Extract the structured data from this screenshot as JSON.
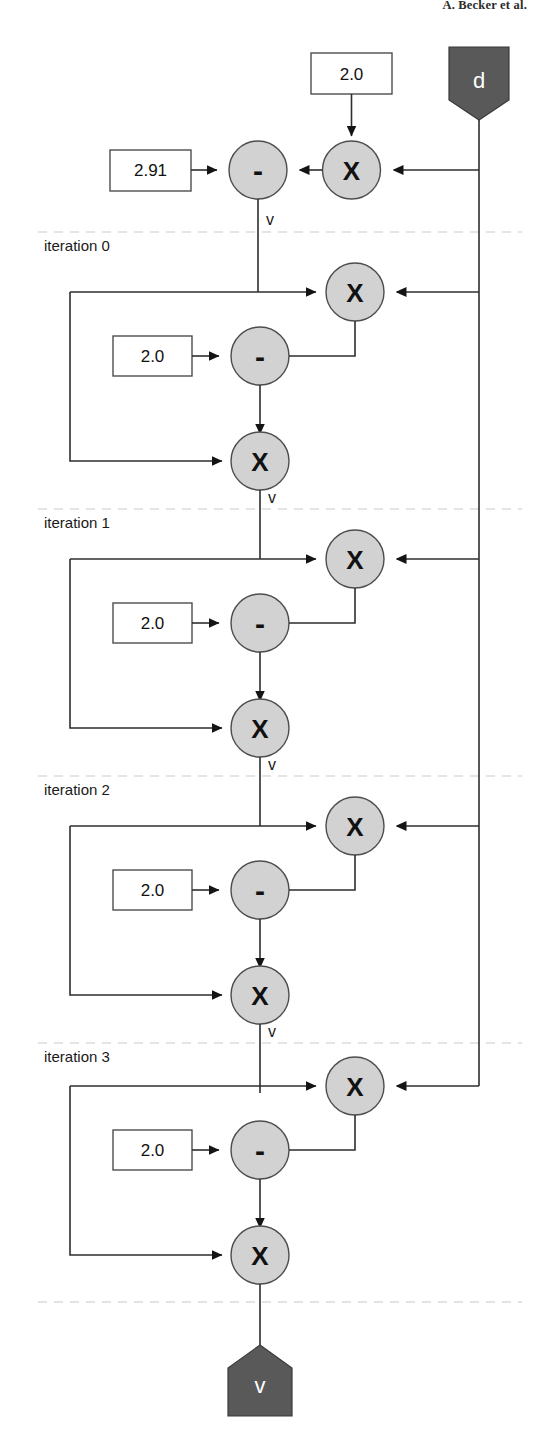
{
  "header": {
    "running_head": "A. Becker et al."
  },
  "diagram": {
    "colors": {
      "node_fill": "#d2d2d2",
      "node_stroke": "#4d4d4d",
      "terminal_fill": "#595959",
      "edge": "#2e2e2e",
      "separator": "#c9c9c9",
      "box_fill": "#ffffff"
    },
    "input_terminal": {
      "label": "d",
      "shape": "pentagon-down"
    },
    "output_terminal": {
      "label": "v",
      "shape": "pentagon-up"
    },
    "edge_variable_label": "v",
    "top_block": {
      "seed_const": "2.91",
      "mul_const": "2.0",
      "mul_op": "X",
      "sub_op": "-",
      "out_label": "v"
    },
    "iterations": [
      {
        "label": "iteration 0",
        "const": "2.0",
        "mul_top_op": "X",
        "sub_op": "-",
        "mul_bottom_op": "X",
        "out_label": "v"
      },
      {
        "label": "iteration 1",
        "const": "2.0",
        "mul_top_op": "X",
        "sub_op": "-",
        "mul_bottom_op": "X",
        "out_label": "v"
      },
      {
        "label": "iteration 2",
        "const": "2.0",
        "mul_top_op": "X",
        "sub_op": "-",
        "mul_bottom_op": "X",
        "out_label": "v"
      },
      {
        "label": "iteration 3",
        "const": "2.0",
        "mul_top_op": "X",
        "sub_op": "-",
        "mul_bottom_op": "X",
        "out_label": "v"
      }
    ]
  }
}
